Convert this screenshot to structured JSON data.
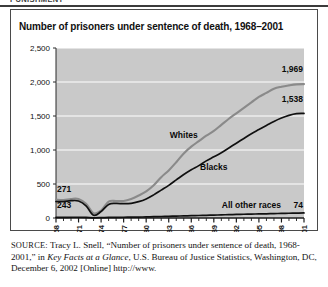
{
  "page": {
    "running_header": "PUNISHMENT",
    "source_note": {
      "label": "SOURCE:",
      "text_part1": " Tracy L. Snell, “Number of prisoners under sentence of death, 1968-2001,” in ",
      "italic_title": "Key Facts at a Glance",
      "text_part2": ", U.S. Bureau of Justice Statistics, Washington, DC, December 6, 2002 [Online] http://www."
    }
  },
  "figure": {
    "title": "Number of prisoners under sentence of death, 1968–2001"
  },
  "chart_data": {
    "type": "line",
    "title": "Number of prisoners under sentence of death, 1968–2001",
    "xlabel": "",
    "ylabel": "",
    "ylim": [
      0,
      2500
    ],
    "yticks": [
      0,
      500,
      1000,
      1500,
      2000,
      2500
    ],
    "ytick_labels": [
      "0",
      "500",
      "1,000",
      "1,500",
      "2,000",
      "2,500"
    ],
    "xlim": [
      1968,
      2001
    ],
    "xticks": [
      1968,
      1971,
      1974,
      1977,
      1980,
      1983,
      1986,
      1989,
      1992,
      1995,
      1998,
      2001
    ],
    "xtick_labels": [
      "68",
      "71",
      "74",
      "77",
      "80",
      "83",
      "86",
      "89",
      "92",
      "95",
      "98",
      "01"
    ],
    "grid": "horizontal-white",
    "plot_background": "#c9c9c9",
    "legend_position": "inline-annotations",
    "x": [
      1968,
      1969,
      1970,
      1971,
      1972,
      1973,
      1974,
      1975,
      1976,
      1977,
      1978,
      1979,
      1980,
      1981,
      1982,
      1983,
      1984,
      1985,
      1986,
      1987,
      1988,
      1989,
      1990,
      1991,
      1992,
      1993,
      1994,
      1995,
      1996,
      1997,
      1998,
      1999,
      2000,
      2001
    ],
    "series": [
      {
        "name": "Whites",
        "color": "#8a8a8a",
        "start_label": "271",
        "end_label": "1,969",
        "start_value": 271,
        "end_value": 1969,
        "values": [
          271,
          265,
          280,
          280,
          210,
          70,
          110,
          240,
          250,
          250,
          280,
          330,
          390,
          480,
          600,
          700,
          820,
          950,
          1050,
          1130,
          1210,
          1280,
          1370,
          1460,
          1540,
          1620,
          1700,
          1780,
          1840,
          1900,
          1930,
          1950,
          1965,
          1969
        ]
      },
      {
        "name": "Blacks",
        "color": "#101010",
        "start_label": "243",
        "end_label": "1,538",
        "start_value": 243,
        "end_value": 1538,
        "values": [
          243,
          240,
          255,
          250,
          180,
          40,
          95,
          200,
          215,
          210,
          215,
          240,
          280,
          340,
          410,
          480,
          560,
          640,
          710,
          770,
          840,
          900,
          960,
          1030,
          1100,
          1170,
          1240,
          1300,
          1360,
          1420,
          1470,
          1510,
          1535,
          1538
        ]
      },
      {
        "name": "All other races",
        "color": "#101010",
        "end_label": "74",
        "end_value": 74,
        "values": [
          10,
          10,
          11,
          11,
          8,
          3,
          5,
          9,
          10,
          11,
          12,
          14,
          16,
          19,
          22,
          25,
          28,
          31,
          34,
          37,
          40,
          43,
          46,
          49,
          52,
          55,
          57,
          60,
          62,
          65,
          68,
          70,
          72,
          74
        ]
      }
    ],
    "annotations": [
      {
        "text": "Whites",
        "x": 1985,
        "y": 1180
      },
      {
        "text": "Blacks",
        "x": 1989,
        "y": 700
      },
      {
        "text": "All other races",
        "x": 1994,
        "y": 150
      },
      {
        "text": "271",
        "x": 1968,
        "y": 380
      },
      {
        "text": "243",
        "x": 1968,
        "y": 150
      },
      {
        "text": "1,969",
        "x": 2001,
        "y": 2150
      },
      {
        "text": "1,538",
        "x": 2001,
        "y": 1700
      },
      {
        "text": "74",
        "x": 2001,
        "y": 150
      }
    ]
  }
}
